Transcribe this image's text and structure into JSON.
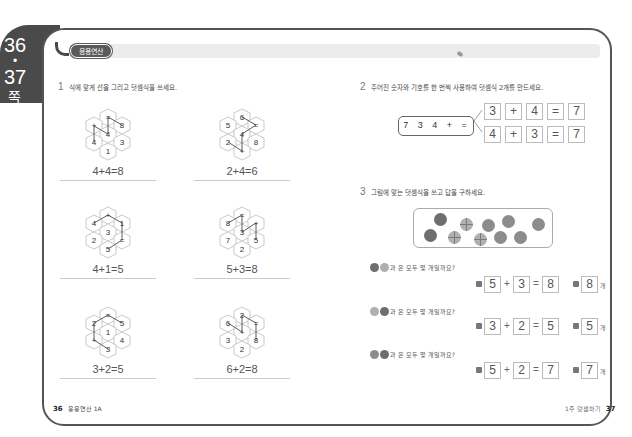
{
  "side_tab": {
    "page_top": "36",
    "dot": "•",
    "page_bottom": "37",
    "suffix": "쪽"
  },
  "header": {
    "badge": "응용연산"
  },
  "q1": {
    "number": "1",
    "title": "식에 맞게 선을 그리고 덧셈식을 쓰세요.",
    "puzzles": [
      {
        "cells": [
          "=",
          "+",
          "8",
          "4",
          "4",
          "3",
          "1"
        ],
        "answer": "4+4=8"
      },
      {
        "cells": [
          "6",
          "5",
          "=",
          "4",
          "2",
          "8",
          "+"
        ],
        "answer": "2+4=6"
      },
      {
        "cells": [
          "+",
          "4",
          "1",
          "3",
          "2",
          "=",
          "5"
        ],
        "answer": "4+1=5"
      },
      {
        "cells": [
          "=",
          "8",
          "+",
          "3",
          "7",
          "5",
          "2"
        ],
        "answer": "5+3=8"
      },
      {
        "cells": [
          "=",
          "2",
          "5",
          "1",
          "+",
          "4",
          "3"
        ],
        "answer": "3+2=5"
      },
      {
        "cells": [
          "2",
          "6",
          "=",
          "+",
          "3",
          "8",
          "2"
        ],
        "answer": "6+2=8"
      }
    ]
  },
  "q2": {
    "number": "2",
    "title": "주어진 숫자와 기호를 한 번씩 사용하여 덧셈식 2개를 만드세요.",
    "given": "7 3 4 + =",
    "rows": [
      [
        "3",
        "+",
        "4",
        "=",
        "7"
      ],
      [
        "4",
        "+",
        "3",
        "=",
        "7"
      ]
    ]
  },
  "q3": {
    "number": "3",
    "title": "그림에 맞는 덧셈식을 쓰고 답을 구하세요.",
    "items": [
      {
        "prompt": "과 은 모두 몇 개일까요?",
        "a": "5",
        "op": "+",
        "b": "3",
        "eq": "=",
        "sum": "8",
        "answer": "8",
        "unit": "개"
      },
      {
        "prompt": "과 은 모두 몇 개일까요?",
        "a": "3",
        "op": "+",
        "b": "2",
        "eq": "=",
        "sum": "5",
        "answer": "5",
        "unit": "개"
      },
      {
        "prompt": "과 은 모두 몇 개일까요?",
        "a": "5",
        "op": "+",
        "b": "2",
        "eq": "=",
        "sum": "7",
        "answer": "7",
        "unit": "개"
      }
    ]
  },
  "footer": {
    "left_page": "36",
    "left_label": "응용연산 1A",
    "right_label": "1주 덧셈하기",
    "right_page": "37"
  }
}
